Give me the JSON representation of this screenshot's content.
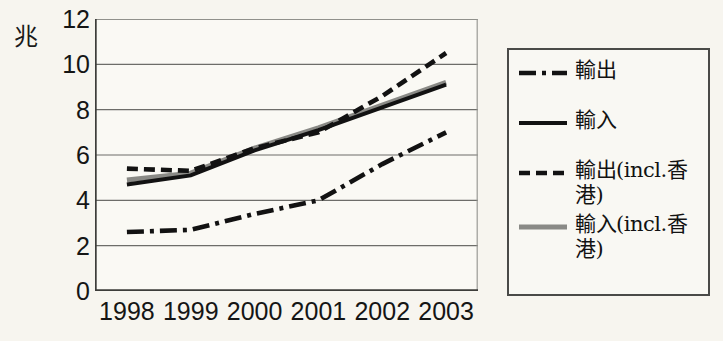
{
  "unit_label": "兆",
  "axes": {
    "y_ticks": [
      0,
      2,
      4,
      6,
      8,
      10,
      12
    ],
    "y_min": 0,
    "y_max": 12,
    "x_ticks": [
      "1998",
      "1999",
      "2000",
      "2001",
      "2002",
      "2003"
    ]
  },
  "legend": {
    "items": [
      {
        "label": "輸出",
        "style": "dash-dot",
        "color": "#121212"
      },
      {
        "label": "輸入",
        "style": "solid",
        "color": "#121212"
      },
      {
        "label": "輸出(incl.香港)",
        "style": "dashed",
        "color": "#121212"
      },
      {
        "label": "輸入(incl.香港)",
        "style": "solid",
        "color": "#8a8a86"
      }
    ]
  },
  "chart_data": {
    "type": "line",
    "title": "",
    "xlabel": "",
    "ylabel": "兆",
    "ylim": [
      0,
      12
    ],
    "grid": true,
    "legend_position": "right",
    "categories": [
      "1998",
      "1999",
      "2000",
      "2001",
      "2002",
      "2003"
    ],
    "series": [
      {
        "name": "輸出",
        "style": "dash-dot",
        "color": "#121212",
        "values": [
          2.6,
          2.7,
          3.4,
          4.0,
          5.6,
          7.0
        ]
      },
      {
        "name": "輸入",
        "style": "solid",
        "color": "#121212",
        "values": [
          4.7,
          5.1,
          6.2,
          7.1,
          8.1,
          9.1
        ]
      },
      {
        "name": "輸出(incl.香港)",
        "style": "dashed",
        "color": "#121212",
        "values": [
          5.4,
          5.3,
          6.3,
          7.0,
          8.6,
          10.5
        ]
      },
      {
        "name": "輸入(incl.香港)",
        "style": "solid",
        "color": "#8a8a86",
        "values": [
          4.9,
          5.2,
          6.3,
          7.2,
          8.2,
          9.2
        ]
      }
    ]
  }
}
